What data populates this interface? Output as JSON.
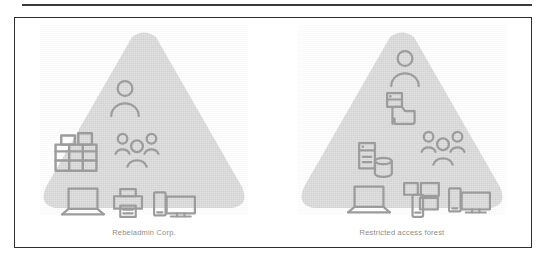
{
  "figure": {
    "background_color": "#ffffff",
    "frame_border_color": "#2e2e2e",
    "rule_color": "#3a3a3a",
    "triangle_fill": "#d6d6d6",
    "icon_stroke": "#9c9c9c",
    "caption_color": "#8d8d8d",
    "forests": [
      {
        "id": "left-forest",
        "caption": "Rebeladmin Corp.",
        "icons": [
          {
            "name": "user-icon",
            "label": "User"
          },
          {
            "name": "office-building-icon",
            "label": "Office building"
          },
          {
            "name": "user-group-icon",
            "label": "User group"
          },
          {
            "name": "laptop-icon",
            "label": "Laptop"
          },
          {
            "name": "printer-icon",
            "label": "Printer"
          },
          {
            "name": "phone-monitor-icon",
            "label": "Mobile and desktop devices"
          }
        ]
      },
      {
        "id": "right-forest",
        "caption": "Restricted access forest",
        "icons": [
          {
            "name": "user-icon",
            "label": "User"
          },
          {
            "name": "server-folder-icon",
            "label": "Server and folder"
          },
          {
            "name": "server-database-icon",
            "label": "Server and database"
          },
          {
            "name": "user-group-icon",
            "label": "User group"
          },
          {
            "name": "laptop-icon",
            "label": "Laptop"
          },
          {
            "name": "device-cluster-icon",
            "label": "Device cluster"
          },
          {
            "name": "phone-monitor-icon",
            "label": "Mobile and desktop devices"
          }
        ]
      }
    ]
  }
}
